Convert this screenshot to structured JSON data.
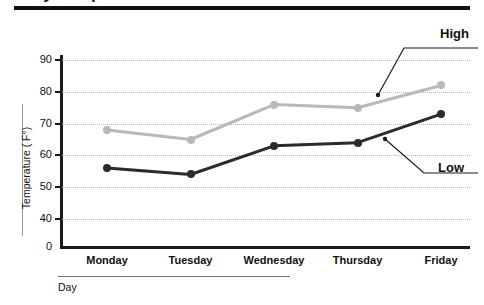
{
  "chart_data": {
    "type": "line",
    "title": "Daily Temperatures",
    "xlabel": "Day",
    "ylabel": "Temperature ( F°)",
    "categories": [
      "Monday",
      "Tuesday",
      "Wednesday",
      "Thursday",
      "Friday"
    ],
    "series": [
      {
        "name": "High",
        "values": [
          68,
          65,
          76,
          75,
          82
        ],
        "color": "#b9b9b9"
      },
      {
        "name": "Low",
        "values": [
          56,
          54,
          63,
          64,
          73
        ],
        "color": "#2b2b2b"
      }
    ],
    "yticks": [
      90,
      80,
      70,
      60,
      50,
      40,
      0
    ],
    "ylim": [
      40,
      90
    ],
    "axis_break": true,
    "grid": "horizontal-dotted",
    "legend": "annotations",
    "annotations": [
      {
        "label": "High",
        "target_series": "High",
        "target_x": "Thursday"
      },
      {
        "label": "Low",
        "target_series": "Low",
        "target_x": "Thursday"
      }
    ]
  },
  "axes": {
    "y_title": "Temperature ( F°)",
    "x_title": "Day",
    "y_tick_labels": [
      "90",
      "80",
      "70",
      "60",
      "50",
      "40",
      "0"
    ],
    "x_tick_labels": [
      "Monday",
      "Tuesday",
      "Wednesday",
      "Thursday",
      "Friday"
    ]
  },
  "annotations": {
    "high_label": "High",
    "low_label": "Low"
  },
  "header": {
    "title": "Daily Temperatures"
  },
  "colors": {
    "high_series": "#b9b9b9",
    "low_series": "#2b2b2b",
    "axis": "#1a1a1a",
    "grid": "#b9b9b9",
    "background": "#ffffff"
  }
}
